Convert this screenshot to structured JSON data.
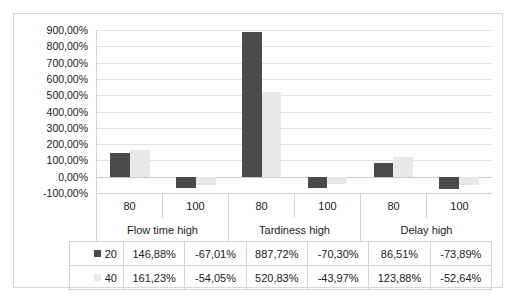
{
  "chart_data": {
    "type": "bar",
    "title": "",
    "xlabel": "",
    "ylabel": "",
    "grid": true,
    "legend_position": "data-table-left",
    "ylim": [
      -100,
      900
    ],
    "ytick_labels": [
      "900,00%",
      "800,00%",
      "700,00%",
      "600,00%",
      "500,00%",
      "400,00%",
      "300,00%",
      "200,00%",
      "100,00%",
      "0,00%",
      "-100,00%"
    ],
    "ytick_values": [
      900,
      800,
      700,
      600,
      500,
      400,
      300,
      200,
      100,
      0,
      -100
    ],
    "groups": [
      "Flow time high",
      "Tardiness high",
      "Delay high"
    ],
    "categories": [
      "80",
      "100",
      "80",
      "100",
      "80",
      "100"
    ],
    "series": [
      {
        "name": "20",
        "color": "#4a4a4a",
        "values": [
          146.88,
          -67.01,
          887.72,
          -70.3,
          86.51,
          -73.89
        ],
        "labels": [
          "146,88%",
          "-67,01%",
          "887,72%",
          "-70,30%",
          "86,51%",
          "-73,89%"
        ]
      },
      {
        "name": "40",
        "color": "#e9e9e9",
        "values": [
          161.23,
          -54.05,
          520.83,
          -43.97,
          123.88,
          -52.64
        ],
        "labels": [
          "161,23%",
          "-54,05%",
          "520,83%",
          "-43,97%",
          "123,88%",
          "-52,64%"
        ]
      }
    ]
  },
  "colors": {
    "series_20": "#4a4a4a",
    "series_40": "#e9e9e9",
    "gridline": "#e3e3e3",
    "border": "#d9d9d9",
    "text": "#1a1a1a"
  }
}
